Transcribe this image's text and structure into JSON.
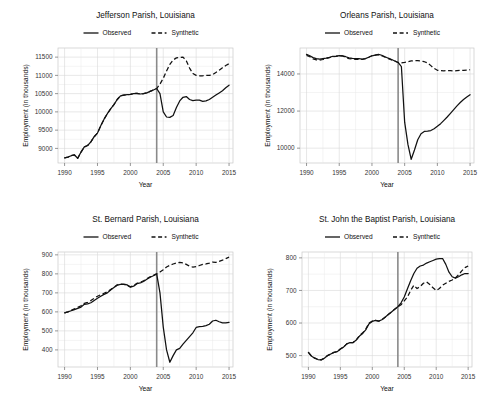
{
  "figure": {
    "layout": "2x2 grid of line charts",
    "panel_count": 4
  },
  "legend": {
    "observed_label": "Observed",
    "synthetic_label": "Synthetic"
  },
  "axis": {
    "xlabel": "Year",
    "ylabel": "Employment (in thousands)"
  },
  "chart_data": [
    {
      "type": "line",
      "title": "Jefferson Parish, Louisiana",
      "xlabel": "Year",
      "ylabel": "Employment (in thousands)",
      "xlim": [
        1989,
        2015.6
      ],
      "ylim": [
        8600,
        11750
      ],
      "xticks": [
        1990,
        1995,
        2000,
        2005,
        2010,
        2015
      ],
      "yticks": [
        9000,
        9500,
        10000,
        10500,
        11000,
        11500
      ],
      "grid": true,
      "legend_position": "above-axes",
      "intervention_year": 2004,
      "x": [
        1990,
        1990.5,
        1991,
        1991.5,
        1992,
        1992.5,
        1993,
        1993.5,
        1994,
        1994.5,
        1995,
        1995.5,
        1996,
        1996.5,
        1997,
        1997.5,
        1998,
        1998.5,
        1999,
        1999.5,
        2000,
        2000.5,
        2001,
        2001.5,
        2002,
        2002.5,
        2003,
        2003.5,
        2004,
        2004.5,
        2005,
        2005.5,
        2006,
        2006.5,
        2007,
        2007.5,
        2008,
        2008.5,
        2009,
        2009.5,
        2010,
        2010.5,
        2011,
        2011.5,
        2012,
        2012.5,
        2013,
        2013.5,
        2014,
        2014.5,
        2015
      ],
      "series": [
        {
          "name": "Observed",
          "style": "solid",
          "values": [
            8740,
            8760,
            8800,
            8820,
            8730,
            8900,
            9040,
            9080,
            9180,
            9320,
            9420,
            9620,
            9800,
            9950,
            10080,
            10200,
            10340,
            10440,
            10460,
            10470,
            10480,
            10500,
            10510,
            10490,
            10500,
            10520,
            10560,
            10600,
            10640,
            10500,
            10000,
            9860,
            9850,
            9900,
            10120,
            10300,
            10400,
            10420,
            10340,
            10310,
            10320,
            10320,
            10290,
            10300,
            10340,
            10400,
            10460,
            10520,
            10580,
            10660,
            10730
          ]
        },
        {
          "name": "Synthetic",
          "style": "dashed",
          "values": [
            8740,
            8760,
            8800,
            8820,
            8730,
            8900,
            9040,
            9080,
            9180,
            9320,
            9420,
            9620,
            9800,
            9950,
            10080,
            10200,
            10340,
            10440,
            10460,
            10470,
            10480,
            10500,
            10510,
            10490,
            10500,
            10520,
            10560,
            10600,
            10640,
            10760,
            10920,
            11120,
            11300,
            11420,
            11480,
            11490,
            11500,
            11400,
            11200,
            11050,
            11000,
            10990,
            10990,
            11000,
            11000,
            11020,
            11080,
            11140,
            11210,
            11270,
            11320
          ]
        }
      ]
    },
    {
      "type": "line",
      "title": "Orleans Parish, Louisiana",
      "xlabel": "Year",
      "ylabel": "Employment (in thousands)",
      "xlim": [
        1989,
        2015.6
      ],
      "ylim": [
        9200,
        15400
      ],
      "xticks": [
        1990,
        1995,
        2000,
        2005,
        2010,
        2015
      ],
      "yticks": [
        10000,
        12000,
        14000
      ],
      "grid": true,
      "legend_position": "above-axes",
      "intervention_year": 2004,
      "x": [
        1990,
        1990.5,
        1991,
        1991.5,
        1992,
        1992.5,
        1993,
        1993.5,
        1994,
        1994.5,
        1995,
        1995.5,
        1996,
        1996.5,
        1997,
        1997.5,
        1998,
        1998.5,
        1999,
        1999.5,
        2000,
        2000.5,
        2001,
        2001.5,
        2002,
        2002.5,
        2003,
        2003.5,
        2004,
        2004.5,
        2005,
        2005.5,
        2006,
        2006.5,
        2007,
        2007.5,
        2008,
        2008.5,
        2009,
        2009.5,
        2010,
        2010.5,
        2011,
        2011.5,
        2012,
        2012.5,
        2013,
        2013.5,
        2014,
        2014.5,
        2015
      ],
      "series": [
        {
          "name": "Observed",
          "style": "solid",
          "values": [
            15060,
            14980,
            14880,
            14830,
            14800,
            14830,
            14860,
            14900,
            14950,
            14960,
            14990,
            14980,
            14930,
            14870,
            14840,
            14830,
            14830,
            14800,
            14830,
            14900,
            14980,
            15020,
            15060,
            15010,
            14930,
            14850,
            14780,
            14700,
            14620,
            14400,
            11400,
            10200,
            9400,
            9900,
            10450,
            10780,
            10900,
            10920,
            10950,
            11050,
            11180,
            11320,
            11500,
            11680,
            11880,
            12080,
            12280,
            12460,
            12620,
            12760,
            12880
          ]
        },
        {
          "name": "Synthetic",
          "style": "dashed",
          "values": [
            15000,
            14930,
            14810,
            14760,
            14740,
            14780,
            14830,
            14880,
            14930,
            14950,
            14980,
            14970,
            14900,
            14830,
            14800,
            14790,
            14790,
            14780,
            14830,
            14900,
            14980,
            15010,
            15040,
            14980,
            14900,
            14830,
            14760,
            14690,
            14620,
            14600,
            14620,
            14660,
            14700,
            14720,
            14720,
            14700,
            14660,
            14600,
            14450,
            14300,
            14200,
            14180,
            14170,
            14180,
            14180,
            14160,
            14180,
            14200,
            14200,
            14210,
            14230
          ]
        }
      ]
    },
    {
      "type": "line",
      "title": "St. Bernard Parish, Louisiana",
      "xlabel": "Year",
      "ylabel": "Employment (in thousands)",
      "xlim": [
        1989,
        2015.6
      ],
      "ylim": [
        310,
        915
      ],
      "xticks": [
        1990,
        1995,
        2000,
        2005,
        2010,
        2015
      ],
      "yticks": [
        400,
        500,
        600,
        700,
        800,
        900
      ],
      "grid": true,
      "legend_position": "above-axes",
      "intervention_year": 2004,
      "x": [
        1990,
        1990.5,
        1991,
        1991.5,
        1992,
        1992.5,
        1993,
        1993.5,
        1994,
        1994.5,
        1995,
        1995.5,
        1996,
        1996.5,
        1997,
        1997.5,
        1998,
        1998.5,
        1999,
        1999.5,
        2000,
        2000.5,
        2001,
        2001.5,
        2002,
        2002.5,
        2003,
        2003.5,
        2004,
        2004.5,
        2005,
        2005.5,
        2006,
        2006.5,
        2007,
        2007.5,
        2008,
        2008.5,
        2009,
        2009.5,
        2010,
        2010.5,
        2011,
        2011.5,
        2012,
        2012.5,
        2013,
        2013.5,
        2014,
        2014.5,
        2015
      ],
      "series": [
        {
          "name": "Observed",
          "style": "solid",
          "values": [
            595,
            600,
            606,
            612,
            618,
            625,
            640,
            642,
            648,
            660,
            672,
            682,
            692,
            700,
            715,
            728,
            740,
            745,
            746,
            742,
            730,
            735,
            748,
            752,
            760,
            772,
            782,
            790,
            800,
            700,
            520,
            400,
            335,
            370,
            400,
            408,
            430,
            450,
            470,
            490,
            518,
            522,
            524,
            528,
            535,
            552,
            556,
            548,
            542,
            542,
            545
          ]
        },
        {
          "name": "Synthetic",
          "style": "dashed",
          "values": [
            595,
            600,
            608,
            616,
            624,
            632,
            645,
            650,
            660,
            672,
            682,
            690,
            698,
            706,
            718,
            730,
            742,
            746,
            744,
            740,
            732,
            738,
            750,
            756,
            764,
            774,
            784,
            792,
            800,
            810,
            822,
            836,
            845,
            852,
            857,
            860,
            858,
            850,
            840,
            836,
            838,
            844,
            850,
            852,
            856,
            862,
            860,
            866,
            872,
            880,
            888
          ]
        }
      ]
    },
    {
      "type": "line",
      "title": "St. John the Baptist Parish, Louisiana",
      "xlabel": "Year",
      "ylabel": "Employment (in thousands)",
      "xlim": [
        1989,
        2015.6
      ],
      "ylim": [
        465,
        818
      ],
      "xticks": [
        1990,
        1995,
        2000,
        2005,
        2010,
        2015
      ],
      "yticks": [
        500,
        600,
        700,
        800
      ],
      "grid": true,
      "legend_position": "above-axes",
      "intervention_year": 2004,
      "x": [
        1990,
        1990.5,
        1991,
        1991.5,
        1992,
        1992.5,
        1993,
        1993.5,
        1994,
        1994.5,
        1995,
        1995.5,
        1996,
        1996.5,
        1997,
        1997.5,
        1998,
        1998.5,
        1999,
        1999.5,
        2000,
        2000.5,
        2001,
        2001.5,
        2002,
        2002.5,
        2003,
        2003.5,
        2004,
        2004.5,
        2005,
        2005.5,
        2006,
        2006.5,
        2007,
        2007.5,
        2008,
        2008.5,
        2009,
        2009.5,
        2010,
        2010.5,
        2011,
        2011.5,
        2012,
        2012.5,
        2013,
        2013.5,
        2014,
        2014.5,
        2015
      ],
      "series": [
        {
          "name": "Observed",
          "style": "solid",
          "values": [
            510,
            498,
            492,
            488,
            487,
            492,
            500,
            505,
            510,
            512,
            520,
            526,
            536,
            540,
            540,
            548,
            560,
            568,
            580,
            598,
            605,
            608,
            606,
            610,
            618,
            626,
            634,
            642,
            650,
            662,
            680,
            705,
            730,
            752,
            768,
            775,
            778,
            784,
            788,
            792,
            796,
            798,
            798,
            780,
            756,
            742,
            738,
            742,
            748,
            752,
            752
          ]
        },
        {
          "name": "Synthetic",
          "style": "dashed",
          "values": [
            510,
            498,
            492,
            488,
            487,
            492,
            500,
            505,
            510,
            512,
            520,
            526,
            536,
            540,
            540,
            548,
            562,
            570,
            582,
            600,
            606,
            608,
            606,
            610,
            618,
            626,
            634,
            642,
            650,
            656,
            668,
            680,
            700,
            716,
            706,
            712,
            722,
            726,
            718,
            708,
            700,
            706,
            716,
            722,
            728,
            732,
            738,
            748,
            760,
            770,
            775
          ]
        }
      ]
    }
  ]
}
